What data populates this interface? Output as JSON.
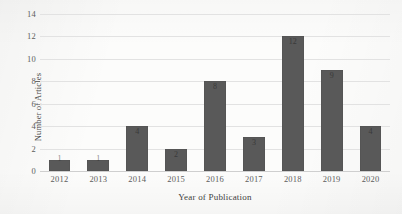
{
  "chart_data": {
    "type": "bar",
    "title": "",
    "xlabel": "Year of Publication",
    "ylabel": "Number of Articles",
    "categories": [
      "2012",
      "2013",
      "2014",
      "2015",
      "2016",
      "2017",
      "2018",
      "2019",
      "2020"
    ],
    "values": [
      1,
      1,
      4,
      2,
      8,
      3,
      12,
      9,
      4
    ],
    "data_labels": [
      "1",
      "1",
      "4",
      "2",
      "8",
      "3",
      "12",
      "9",
      "4"
    ],
    "ylim": [
      0,
      14
    ],
    "yticks": [
      0,
      2,
      4,
      6,
      8,
      10,
      12,
      14
    ],
    "ytick_labels": [
      "0",
      "2",
      "4",
      "6",
      "8",
      "10",
      "12",
      "14"
    ],
    "grid": "horizontal",
    "legend": "none",
    "series": [
      {
        "name": "Number of Articles",
        "values": [
          1,
          1,
          4,
          2,
          8,
          3,
          12,
          9,
          4
        ]
      }
    ],
    "colors": {
      "bar": "#595959",
      "gridline": "#e2e2e2",
      "axis_text": "#5d5d5d",
      "background": "#fcfcfb",
      "data_label": "#2f2f2f"
    }
  }
}
